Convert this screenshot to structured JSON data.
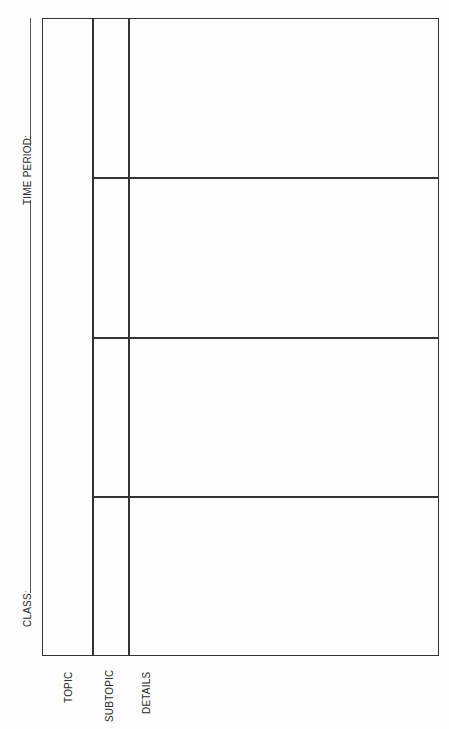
{
  "header": {
    "class_label": "CLASS:",
    "time_period_label": "TIME PERIOD:"
  },
  "columns": {
    "topic_label": "TOPIC",
    "subtopic_label": "SUBTOPIC",
    "details_label": "DETAILS"
  },
  "rows": [
    {
      "topic": "",
      "subtopic": "",
      "details": ""
    },
    {
      "topic": "",
      "subtopic": "",
      "details": ""
    },
    {
      "topic": "",
      "subtopic": "",
      "details": ""
    },
    {
      "topic": "",
      "subtopic": "",
      "details": ""
    }
  ]
}
